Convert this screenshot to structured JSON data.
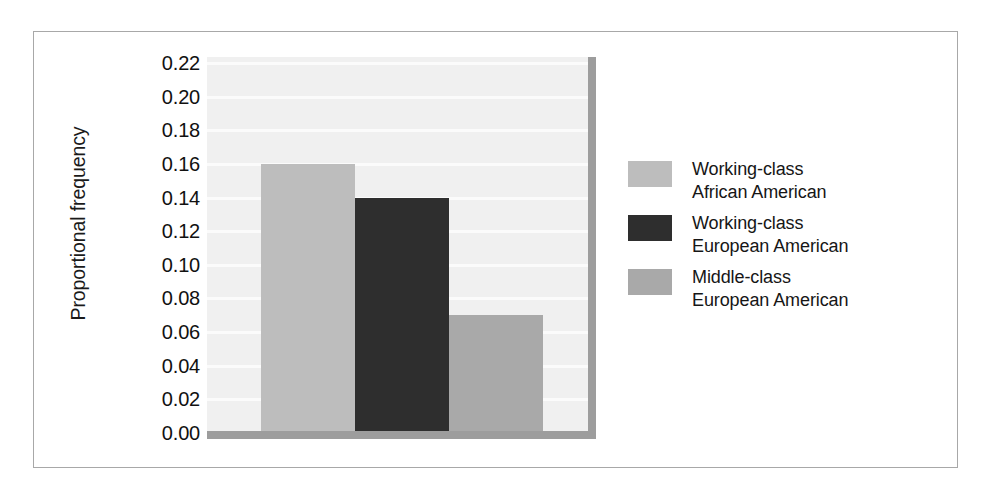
{
  "chart_data": {
    "type": "bar",
    "title": "",
    "subtitle": "",
    "xlabel": "",
    "ylabel": "Proportional frequency",
    "ylim": [
      0.0,
      0.22
    ],
    "ytick_step": 0.02,
    "ytick_labels": [
      "0.22",
      "0.20",
      "0.18",
      "0.16",
      "0.14",
      "0.12",
      "0.10",
      "0.08",
      "0.06",
      "0.04",
      "0.02",
      "0.00"
    ],
    "grid": true,
    "grid_axis": "y",
    "legend_position": "right",
    "categories": [
      "Working-class African American",
      "Working-class European American",
      "Middle-class European American"
    ],
    "values": [
      0.16,
      0.14,
      0.07
    ],
    "bar_colors": [
      "#bdbdbd",
      "#2e2e2e",
      "#a9a9a9"
    ],
    "plot_background": "#f0f0f0",
    "gridline_color": "#fbfbfb",
    "axis_shadow_color": "#9d9d9d",
    "frame_border_color": "#a8a8a8",
    "series": [
      {
        "name": "Working-class African American",
        "label_line1": "Working-class",
        "label_line2": "African American",
        "value": 0.16,
        "color": "#bdbdbd"
      },
      {
        "name": "Working-class European American",
        "label_line1": "Working-class",
        "label_line2": "European American",
        "value": 0.14,
        "color": "#2e2e2e"
      },
      {
        "name": "Middle-class European American",
        "label_line1": "Middle-class",
        "label_line2": "European American",
        "value": 0.07,
        "color": "#a9a9a9"
      }
    ]
  },
  "legend": {
    "items": [
      {
        "label": "Working-class\nAfrican American",
        "color": "#bdbdbd"
      },
      {
        "label": "Working-class\nEuropean American",
        "color": "#2e2e2e"
      },
      {
        "label": "Middle-class\nEuropean American",
        "color": "#a9a9a9"
      }
    ]
  },
  "axis": {
    "y_title": "Proportional frequency"
  }
}
